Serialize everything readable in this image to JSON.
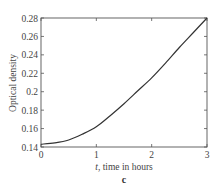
{
  "chart_data": {
    "type": "line",
    "title": "",
    "caption": "c",
    "xlabel_var": "t",
    "xlabel_rest": ", time in hours",
    "ylabel": "Optical density",
    "xlim": [
      0,
      3
    ],
    "ylim": [
      0.14,
      0.28
    ],
    "x_ticks": [
      0,
      1,
      2,
      3
    ],
    "x_tick_labels": [
      "0",
      "1",
      "2",
      "3"
    ],
    "y_ticks": [
      0.14,
      0.16,
      0.18,
      0.2,
      0.22,
      0.24,
      0.26,
      0.28
    ],
    "y_tick_labels": [
      "0.14",
      "0.16",
      "0.18",
      "0.2",
      "0.22",
      "0.24",
      "0.26",
      "0.28"
    ],
    "grid": false,
    "legend": null,
    "series": [
      {
        "name": "Optical density",
        "color": "#333333",
        "x": [
          0,
          0.25,
          0.5,
          0.75,
          1.0,
          1.25,
          1.5,
          1.75,
          2.0,
          2.25,
          2.5,
          2.75,
          3.0
        ],
        "y": [
          0.143,
          0.1445,
          0.1476,
          0.154,
          0.162,
          0.174,
          0.187,
          0.201,
          0.215,
          0.231,
          0.248,
          0.264,
          0.28
        ]
      }
    ]
  }
}
